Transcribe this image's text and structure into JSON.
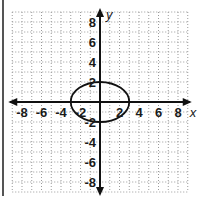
{
  "chart_data": {
    "type": "line",
    "title": "",
    "xlabel": "x",
    "ylabel": "y",
    "xlim": [
      -9,
      9
    ],
    "ylim": [
      -9,
      9
    ],
    "grid": true,
    "grid_style": "dotted",
    "grid_step": 1,
    "x_ticks": [
      -8,
      -6,
      -4,
      -2,
      2,
      4,
      6,
      8
    ],
    "y_ticks": [
      8,
      6,
      4,
      2,
      -2,
      -4,
      -6,
      -8
    ],
    "x_tick_labels": [
      "-8",
      "-6",
      "-4",
      "-2",
      "2",
      "4",
      "6",
      "8"
    ],
    "y_tick_labels": [
      "8",
      "6",
      "4",
      "2",
      "-2",
      "-4",
      "-6",
      "-8"
    ],
    "series": [
      {
        "name": "ellipse",
        "shape": "ellipse",
        "equation": "x^2/9 + y^2/4 = 1",
        "center": [
          0,
          0
        ],
        "semi_axis_x": 3,
        "semi_axis_y": 2,
        "vertices": [
          [
            -3,
            0
          ],
          [
            3,
            0
          ],
          [
            0,
            2
          ],
          [
            0,
            -2
          ]
        ]
      }
    ],
    "legend": null
  },
  "colors": {
    "axis": "#111111",
    "grid": "#9a9a9a",
    "curve": "#111111",
    "frame": "#555555",
    "background": "#ffffff"
  }
}
